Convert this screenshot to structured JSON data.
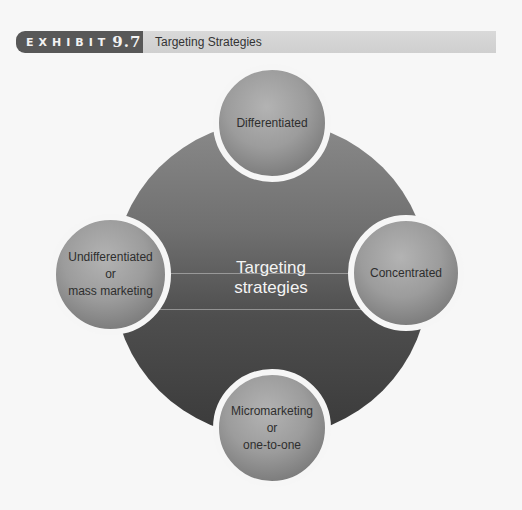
{
  "header": {
    "exhibit_word": "EXHIBIT",
    "exhibit_number": "9.7",
    "title": "Targeting Strategies",
    "badge_color": "#585858",
    "bar_color": "#d6d6d6"
  },
  "diagram": {
    "center": {
      "line1": "Targeting",
      "line2": "strategies"
    },
    "nodes": [
      {
        "position": "top",
        "lines": [
          "Differentiated"
        ]
      },
      {
        "position": "left",
        "lines": [
          "Undifferentiated",
          "or",
          "mass marketing"
        ]
      },
      {
        "position": "right",
        "lines": [
          "Concentrated"
        ]
      },
      {
        "position": "bottom",
        "lines": [
          "Micromarketing",
          "or",
          "one-to-one"
        ]
      }
    ]
  }
}
